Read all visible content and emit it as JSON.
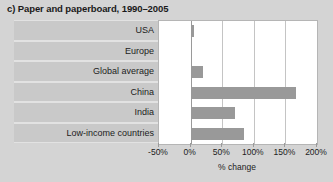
{
  "chart_data": {
    "type": "bar",
    "orientation": "horizontal",
    "title": "c) Paper and paperboard, 1990–2005",
    "xlabel": "% change",
    "ylabel": "",
    "categories": [
      "USA",
      "Europe",
      "Global average",
      "China",
      "India",
      "Low-income countries"
    ],
    "values": [
      5,
      0,
      20,
      166,
      71,
      84
    ],
    "xlim": [
      -50,
      200
    ],
    "xticks": [
      -50,
      0,
      50,
      100,
      150,
      200
    ],
    "xtick_labels": [
      "-50%",
      "0%",
      "50%",
      "100%",
      "150%",
      "200%"
    ],
    "grid": true,
    "legend": false,
    "bar_color": "#999999",
    "plot_background": "#ffffff",
    "figure_background": "#d4d4d4",
    "label_band_color": "#c9c9c9"
  }
}
